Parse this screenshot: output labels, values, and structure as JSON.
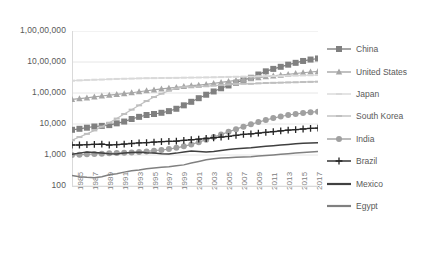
{
  "chart_data": {
    "type": "line",
    "title": "",
    "xlabel": "",
    "ylabel": "",
    "yscale": "log",
    "ylim": [
      100,
      10000000
    ],
    "grid": true,
    "legend_position": "right",
    "ytick_labels": [
      "1,00,00,000",
      "10,00,000",
      "1,00,000",
      "10,000",
      "1,000",
      "100"
    ],
    "ytick_values": [
      10000000,
      1000000,
      100000,
      10000,
      1000,
      100
    ],
    "x": [
      1985,
      1986,
      1987,
      1988,
      1989,
      1990,
      1991,
      1992,
      1993,
      1994,
      1995,
      1996,
      1997,
      1998,
      1999,
      2000,
      2001,
      2002,
      2003,
      2004,
      2005,
      2006,
      2007,
      2008,
      2009,
      2010,
      2011,
      2012,
      2013,
      2014,
      2015,
      2016,
      2017,
      2018
    ],
    "xtick_labels": [
      "1985",
      "1987",
      "1989",
      "1991",
      "1993",
      "1995",
      "1997",
      "1999",
      "2001",
      "2003",
      "2005",
      "2007",
      "2009",
      "2011",
      "2013",
      "2015",
      "2017"
    ],
    "series": [
      {
        "name": "China",
        "color": "#808080",
        "marker": "square",
        "values": [
          6500,
          7000,
          7600,
          8300,
          8700,
          9200,
          10500,
          12000,
          14500,
          17000,
          19500,
          21000,
          23000,
          26000,
          31000,
          40000,
          52000,
          68000,
          88000,
          112000,
          142000,
          175000,
          215000,
          265000,
          310000,
          395000,
          500000,
          600000,
          700000,
          820000,
          940000,
          1080000,
          1200000,
          1300000
        ]
      },
      {
        "name": "United States",
        "color": "#a6a6a6",
        "marker": "triangle",
        "values": [
          62000,
          66000,
          70000,
          75000,
          80000,
          85000,
          90000,
          96000,
          102000,
          110000,
          118000,
          126000,
          135000,
          143000,
          152000,
          162000,
          172000,
          180000,
          190000,
          205000,
          220000,
          238000,
          255000,
          275000,
          292000,
          315000,
          335000,
          355000,
          378000,
          400000,
          425000,
          450000,
          475000,
          500000
        ]
      },
      {
        "name": "Japan",
        "color": "#d9d9d9",
        "marker": "dash",
        "values": [
          250000,
          255000,
          262000,
          268000,
          272000,
          278000,
          284000,
          288000,
          292000,
          296000,
          300000,
          302000,
          305000,
          306000,
          308000,
          312000,
          315000,
          316000,
          318000,
          322000,
          326000,
          330000,
          334000,
          338000,
          340000,
          346000,
          350000,
          352000,
          356000,
          360000,
          364000,
          368000,
          374000,
          380000
        ]
      },
      {
        "name": "South Korea",
        "color": "#bfbfbf",
        "marker": "dash",
        "values": [
          3000,
          3800,
          4800,
          6200,
          8200,
          11000,
          15000,
          21000,
          29000,
          40000,
          55000,
          74000,
          95000,
          118000,
          140000,
          155000,
          160000,
          162000,
          165000,
          172000,
          180000,
          188000,
          196000,
          200000,
          198000,
          205000,
          210000,
          213000,
          216000,
          219000,
          222000,
          226000,
          229000,
          232000
        ]
      },
      {
        "name": "India",
        "color": "#a0a0a0",
        "marker": "circle",
        "values": [
          1000,
          1020,
          1050,
          1080,
          1100,
          1130,
          1150,
          1180,
          1200,
          1250,
          1300,
          1380,
          1450,
          1550,
          1700,
          1900,
          2200,
          2600,
          3100,
          3800,
          4600,
          5600,
          6800,
          8200,
          9800,
          11500,
          13500,
          15500,
          17500,
          19500,
          21000,
          22500,
          24000,
          25000
        ]
      },
      {
        "name": "Brazil",
        "color": "#262626",
        "marker": "plus",
        "values": [
          2100,
          2100,
          2150,
          2200,
          2250,
          2100,
          2150,
          2250,
          2350,
          2450,
          2500,
          2600,
          2700,
          2750,
          2800,
          2950,
          3100,
          3250,
          3400,
          3600,
          3800,
          4000,
          4300,
          4600,
          4800,
          5100,
          5400,
          5700,
          6000,
          6300,
          6600,
          6900,
          7200,
          7400
        ]
      },
      {
        "name": "Mexico",
        "color": "#404040",
        "marker": "none",
        "values": [
          1050,
          1150,
          1250,
          1200,
          1150,
          1100,
          1080,
          1150,
          1200,
          1230,
          1180,
          1150,
          1100,
          1080,
          1150,
          1250,
          1350,
          1300,
          1250,
          1300,
          1400,
          1500,
          1600,
          1650,
          1700,
          1800,
          1900,
          2000,
          2100,
          2200,
          2300,
          2380,
          2450,
          2500
        ]
      },
      {
        "name": "Egypt",
        "color": "#808080",
        "marker": "none",
        "values": [
          220,
          200,
          190,
          185,
          200,
          230,
          250,
          280,
          310,
          330,
          360,
          380,
          400,
          420,
          450,
          480,
          550,
          620,
          700,
          760,
          800,
          820,
          840,
          860,
          880,
          920,
          960,
          1000,
          1050,
          1100,
          1150,
          1200,
          1250,
          1300
        ]
      }
    ]
  },
  "legend": {
    "items": [
      {
        "label": "China"
      },
      {
        "label": "United States"
      },
      {
        "label": "Japan"
      },
      {
        "label": "South Korea"
      },
      {
        "label": "India"
      },
      {
        "label": "Brazil"
      },
      {
        "label": "Mexico"
      },
      {
        "label": "Egypt"
      }
    ]
  }
}
